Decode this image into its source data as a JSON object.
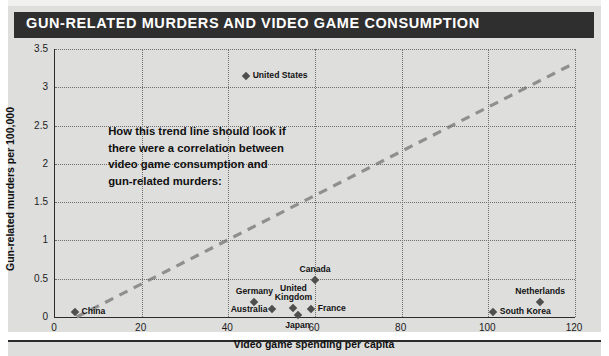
{
  "header": {
    "title": "GUN-RELATED MURDERS AND VIDEO GAME CONSUMPTION"
  },
  "annotation": {
    "text": "How this trend line should look if\nthere were a correlation between\nvideo game consumption and\ngun-related murders:"
  },
  "colors": {
    "panel_background": "#dededd",
    "title_bar": "#2f2f2f",
    "title_text": "#ffffff",
    "point": "#4f4f4f",
    "trendline": "#8f8f8f",
    "grid": "#6e6e6e",
    "axis": "#2b2b2b"
  },
  "chart_data": {
    "type": "scatter",
    "title": "GUN-RELATED MURDERS AND VIDEO GAME CONSUMPTION",
    "xlabel": "Video game spending per capita",
    "ylabel": "Gun-related murders per 100,000",
    "xlim": [
      0,
      120
    ],
    "ylim": [
      0,
      3.5
    ],
    "xticks": [
      "0",
      "20",
      "40",
      "60",
      "80",
      "100",
      "120"
    ],
    "yticks": [
      "0",
      "0.5",
      "1",
      "1.5",
      "2",
      "2.5",
      "3",
      "3.5"
    ],
    "grid": true,
    "legend": "none",
    "points": [
      {
        "label": "United States",
        "x": 44,
        "y": 3.15,
        "label_pos": "right"
      },
      {
        "label": "Canada",
        "x": 60,
        "y": 0.48,
        "label_pos": "above"
      },
      {
        "label": "Germany",
        "x": 46,
        "y": 0.19,
        "label_pos": "above"
      },
      {
        "label": "United\nKingdom",
        "x": 55,
        "y": 0.12,
        "label_pos": "above"
      },
      {
        "label": "France",
        "x": 59,
        "y": 0.1,
        "label_pos": "right"
      },
      {
        "label": "Australia",
        "x": 50,
        "y": 0.1,
        "label_pos": "below-left"
      },
      {
        "label": "Japan",
        "x": 56,
        "y": 0.02,
        "label_pos": "below"
      },
      {
        "label": "China",
        "x": 4.5,
        "y": 0.06,
        "label_pos": "right"
      },
      {
        "label": "South Korea",
        "x": 101,
        "y": 0.06,
        "label_pos": "right"
      },
      {
        "label": "Netherlands",
        "x": 112,
        "y": 0.2,
        "label_pos": "above"
      }
    ],
    "trendline": {
      "x0": 5,
      "y0": 0.0,
      "x1": 120,
      "y1": 3.32,
      "style": "dashed"
    }
  }
}
